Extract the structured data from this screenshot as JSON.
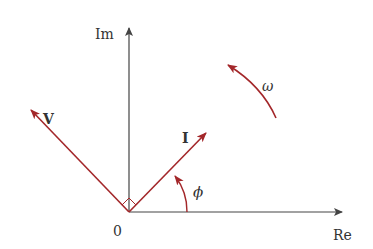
{
  "diagram": {
    "type": "phasor-diagram",
    "colors": {
      "axis": "#444444",
      "phasor": "#a3272a",
      "text": "#333333"
    },
    "axes": {
      "x_label": "Re",
      "y_label": "Im",
      "origin_label": "0"
    },
    "phasors": [
      {
        "name": "V",
        "label": "V",
        "angle_deg": 135
      },
      {
        "name": "I",
        "label": "I",
        "angle_deg": 45
      }
    ],
    "angle_label": "ϕ",
    "rotation_label": "ω",
    "right_angle_marker": true
  }
}
